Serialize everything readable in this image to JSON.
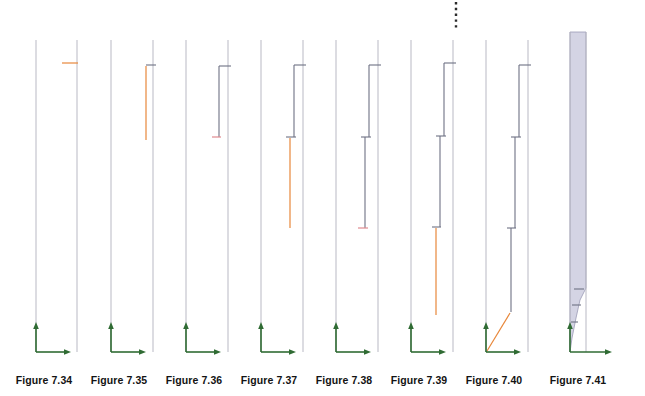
{
  "page": {
    "background_color": "#ffffff",
    "width": 645,
    "height": 396
  },
  "style": {
    "axis_color": "#2f6b33",
    "guide_line_color": "#b9b9c4",
    "step_line_color": "#6e7184",
    "accent_orange": "#e8873a",
    "accent_pink": "#e08a8f",
    "shade_fill": "#cdccdf",
    "shade_stroke": "#9a9ab5",
    "caption_color": "#131313"
  },
  "chart_data": {
    "type": "line",
    "xlabel": "",
    "ylabel": "",
    "grid": false,
    "legend": "none",
    "panel_count": 8,
    "panels": [
      {
        "caption": "Figure 7.34",
        "left_guide_x": 36,
        "right_guide_x": 77,
        "guide_top_y": 40,
        "guide_bottom_y": 352,
        "axis_origin_x": 36,
        "axis_origin_y": 352,
        "axis_vertical_top_y": 322,
        "axis_horizontal_right_x": 71,
        "steps": [],
        "accent_segments": [
          {
            "type": "horizontal",
            "color": "accent_orange",
            "x1": 62,
            "x2": 78,
            "y": 63
          }
        ],
        "dotted_top": false,
        "shaded": false
      },
      {
        "caption": "Figure 7.35",
        "left_guide_x": 111,
        "right_guide_x": 153,
        "guide_top_y": 40,
        "guide_bottom_y": 352,
        "axis_origin_x": 111,
        "axis_origin_y": 352,
        "axis_vertical_top_y": 322,
        "axis_horizontal_right_x": 146,
        "steps": [
          {
            "type": "horizontal",
            "x1": 146,
            "x2": 156,
            "y": 65
          }
        ],
        "accent_segments": [
          {
            "type": "vertical",
            "color": "accent_orange",
            "x": 146,
            "y1": 66,
            "y2": 140
          }
        ],
        "dotted_top": false,
        "shaded": false
      },
      {
        "caption": "Figure 7.36",
        "left_guide_x": 186,
        "right_guide_x": 228,
        "guide_top_y": 40,
        "guide_bottom_y": 352,
        "axis_origin_x": 186,
        "axis_origin_y": 352,
        "axis_vertical_top_y": 322,
        "axis_horizontal_right_x": 221,
        "steps": [
          {
            "type": "horizontal",
            "x1": 219,
            "x2": 231,
            "y": 66
          },
          {
            "type": "vertical",
            "x": 219,
            "y1": 66,
            "y2": 137
          }
        ],
        "accent_segments": [
          {
            "type": "horizontal",
            "color": "accent_pink",
            "x1": 212,
            "x2": 221,
            "y": 137
          }
        ],
        "dotted_top": false,
        "shaded": false
      },
      {
        "caption": "Figure 7.37",
        "left_guide_x": 261,
        "right_guide_x": 303,
        "guide_top_y": 40,
        "guide_bottom_y": 352,
        "axis_origin_x": 261,
        "axis_origin_y": 352,
        "axis_vertical_top_y": 322,
        "axis_horizontal_right_x": 296,
        "steps": [
          {
            "type": "horizontal",
            "x1": 294,
            "x2": 306,
            "y": 65
          },
          {
            "type": "vertical",
            "x": 294,
            "y1": 65,
            "y2": 137
          },
          {
            "type": "horizontal",
            "x1": 286,
            "x2": 296,
            "y": 137
          }
        ],
        "accent_segments": [
          {
            "type": "vertical",
            "color": "accent_orange",
            "x": 290,
            "y1": 138,
            "y2": 228
          }
        ],
        "dotted_top": false,
        "shaded": false
      },
      {
        "caption": "Figure 7.38",
        "left_guide_x": 336,
        "right_guide_x": 378,
        "guide_top_y": 40,
        "guide_bottom_y": 352,
        "axis_origin_x": 336,
        "axis_origin_y": 352,
        "axis_vertical_top_y": 322,
        "axis_horizontal_right_x": 371,
        "steps": [
          {
            "type": "horizontal",
            "x1": 369,
            "x2": 381,
            "y": 65
          },
          {
            "type": "vertical",
            "x": 369,
            "y1": 65,
            "y2": 137
          },
          {
            "type": "horizontal",
            "x1": 361,
            "x2": 371,
            "y": 137
          },
          {
            "type": "vertical",
            "x": 365,
            "y1": 137,
            "y2": 228
          }
        ],
        "accent_segments": [
          {
            "type": "horizontal",
            "color": "accent_pink",
            "x1": 358,
            "x2": 368,
            "y": 228
          }
        ],
        "dotted_top": false,
        "shaded": false
      },
      {
        "caption": "Figure 7.39",
        "left_guide_x": 411,
        "right_guide_x": 453,
        "guide_top_y": 40,
        "guide_bottom_y": 352,
        "axis_origin_x": 411,
        "axis_origin_y": 352,
        "axis_vertical_top_y": 322,
        "axis_horizontal_right_x": 446,
        "steps": [
          {
            "type": "horizontal",
            "x1": 444,
            "x2": 456,
            "y": 63
          },
          {
            "type": "vertical",
            "x": 444,
            "y1": 63,
            "y2": 136
          },
          {
            "type": "horizontal",
            "x1": 436,
            "x2": 446,
            "y": 136
          },
          {
            "type": "vertical",
            "x": 440,
            "y1": 136,
            "y2": 227
          },
          {
            "type": "horizontal",
            "x1": 432,
            "x2": 441,
            "y": 227
          }
        ],
        "accent_segments": [
          {
            "type": "vertical",
            "color": "accent_orange",
            "x": 436,
            "y1": 228,
            "y2": 315
          }
        ],
        "dotted_top": true,
        "dotted_x": 456,
        "dotted_y1": 2,
        "dotted_y2": 30,
        "shaded": false
      },
      {
        "caption": "Figure 7.40",
        "left_guide_x": 486,
        "right_guide_x": 528,
        "guide_top_y": 40,
        "guide_bottom_y": 352,
        "axis_origin_x": 486,
        "axis_origin_y": 352,
        "axis_vertical_top_y": 322,
        "axis_horizontal_right_x": 521,
        "steps": [
          {
            "type": "horizontal",
            "x1": 519,
            "x2": 531,
            "y": 65
          },
          {
            "type": "vertical",
            "x": 519,
            "y1": 65,
            "y2": 137
          },
          {
            "type": "horizontal",
            "x1": 511,
            "x2": 521,
            "y": 137
          },
          {
            "type": "vertical",
            "x": 515,
            "y1": 137,
            "y2": 228
          },
          {
            "type": "horizontal",
            "x1": 507,
            "x2": 516,
            "y": 228
          },
          {
            "type": "vertical",
            "x": 511,
            "y1": 228,
            "y2": 312
          }
        ],
        "accent_segments": [
          {
            "type": "diagonal",
            "color": "accent_orange",
            "x1": 510,
            "y1": 313,
            "x2": 487,
            "y2": 351
          }
        ],
        "dotted_top": false,
        "shaded": false
      },
      {
        "caption": "Figure 7.41",
        "left_guide_x": 570,
        "right_guide_x": 586,
        "guide_top_y": 32,
        "guide_bottom_y": 352,
        "axis_origin_x": 570,
        "axis_origin_y": 352,
        "axis_vertical_top_y": 322,
        "axis_horizontal_right_x": 612,
        "steps": [
          {
            "type": "horizontal",
            "x1": 574,
            "x2": 584,
            "y": 289
          },
          {
            "type": "horizontal",
            "x1": 572,
            "x2": 581,
            "y": 305
          },
          {
            "type": "horizontal",
            "x1": 571,
            "x2": 578,
            "y": 322
          }
        ],
        "accent_segments": [],
        "dotted_top": false,
        "shaded": true,
        "shade_polygon": "570,352 570,32 586,32 586,288 580,300 576,318 572,338"
      }
    ]
  }
}
